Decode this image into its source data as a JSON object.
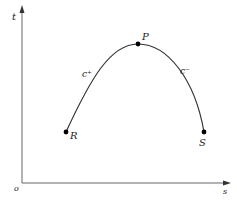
{
  "diagram": {
    "type": "curve-on-axes",
    "axes": {
      "vertical_label": "t",
      "horizontal_label": "s",
      "origin_label": "o"
    },
    "points": [
      {
        "name": "R",
        "label": "R",
        "x": 66,
        "y": 132
      },
      {
        "name": "P",
        "label": "P",
        "x": 138,
        "y": 44
      },
      {
        "name": "S",
        "label": "S",
        "x": 204,
        "y": 132
      }
    ],
    "curve_labels": {
      "left": "c⁺",
      "right": "c⁻"
    },
    "colors": {
      "line": "#333333",
      "axis": "#555555",
      "point": "#000000"
    }
  }
}
